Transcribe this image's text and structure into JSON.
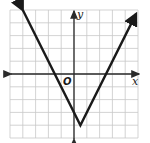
{
  "chart_data": {
    "type": "line",
    "title": "",
    "function": "y = 2|x - 0.5| - 4",
    "vertex": [
      0.5,
      -4
    ],
    "x_intercepts": [
      -1.5,
      2.5
    ],
    "y_intercept": -3,
    "x": [
      -4,
      0.5,
      4.85
    ],
    "y": [
      5,
      -4,
      4.7
    ],
    "xlabel": "x",
    "ylabel": "y",
    "origin_label": "O",
    "xlim": [
      -5,
      5
    ],
    "ylim": [
      -5,
      5
    ],
    "grid": true,
    "grid_step": 1,
    "tick_labels": false
  },
  "labels": {
    "x_axis": "x",
    "y_axis": "y",
    "origin": "O"
  },
  "colors": {
    "grid": "#c8c8c8",
    "axis": "#2a2a2a",
    "graph": "#1a1a1a",
    "background": "#ffffff"
  }
}
